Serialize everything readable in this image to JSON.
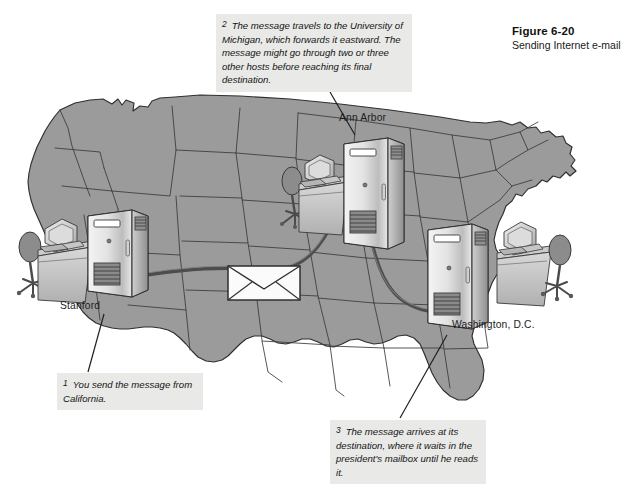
{
  "figure": {
    "number": "Figure 6-20",
    "caption": "Sending Internet e-mail"
  },
  "diagram": {
    "title": "Sending Internet e-mail",
    "map_region": "Continental United States"
  },
  "callouts": [
    {
      "id": "callout-1",
      "number": "1",
      "text": "You send the message from California.",
      "points_to": "Stanford"
    },
    {
      "id": "callout-2",
      "number": "2",
      "text": "The message travels to the University of Michigan, which forwards it eastward.  The message might go through two or three other hosts before reaching its final destination.",
      "points_to": "Ann Arbor"
    },
    {
      "id": "callout-3",
      "number": "3",
      "text": "The message arrives at its destination, where it waits in the president's mailbox until he reads it.",
      "points_to": "Washington, D.C."
    }
  ],
  "cities": [
    {
      "id": "stanford",
      "label": "Stanford"
    },
    {
      "id": "annarbor",
      "label": "Ann Arbor"
    },
    {
      "id": "washington",
      "label": "Washington, D.C."
    }
  ],
  "nodes": [
    {
      "id": "node-stanford",
      "city": "Stanford",
      "icons": [
        "office-chair-icon",
        "desktop-computer-icon",
        "desk-icon",
        "server-cabinet-icon"
      ]
    },
    {
      "id": "node-annarbor",
      "city": "Ann Arbor",
      "icons": [
        "office-chair-icon",
        "desktop-computer-icon",
        "desk-icon",
        "server-cabinet-icon"
      ]
    },
    {
      "id": "node-washington",
      "city": "Washington, D.C.",
      "icons": [
        "server-cabinet-icon",
        "desk-icon",
        "desktop-computer-icon",
        "office-chair-icon"
      ]
    }
  ],
  "message": {
    "icon": "envelope-icon",
    "description": "E-mail message envelope travelling along the network path"
  },
  "colors": {
    "map_fill": "#9b9b9b",
    "map_border": "#2f2f2f",
    "page_background": "#ffffff",
    "callout_background": "#e9e9e7",
    "text": "#141414",
    "path_line": "#4b4b4b",
    "server_light": "#ededed",
    "server_mid": "#b9b9b9",
    "server_dark": "#6e6e6e"
  }
}
